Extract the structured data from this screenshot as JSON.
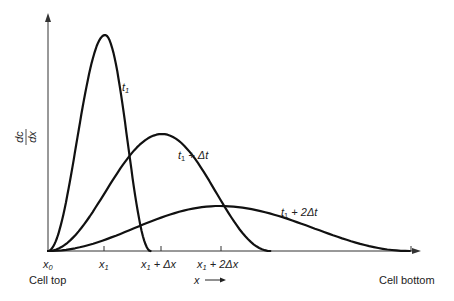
{
  "chart_data": {
    "type": "line",
    "title": "",
    "xlabel": "x",
    "ylabel": "dc/dx",
    "ylabel_numerator": "dc",
    "ylabel_denominator": "dx",
    "x_end_labels": {
      "left": "Cell top",
      "right": "Cell bottom"
    },
    "x_ticks": [
      {
        "value": 0,
        "label_main": "x",
        "label_sub": "0",
        "label_rest": ""
      },
      {
        "value": 1,
        "label_main": "x",
        "label_sub": "1",
        "label_rest": ""
      },
      {
        "value": 2,
        "label_main": "x",
        "label_sub": "1",
        "label_rest": " + Δx"
      },
      {
        "value": 3,
        "label_main": "x",
        "label_sub": "1",
        "label_rest": " + 2Δx"
      }
    ],
    "x_range": [
      0,
      6.6
    ],
    "y_range": [
      0,
      1.0
    ],
    "series": [
      {
        "name": "t1",
        "label_main": "t",
        "label_sub": "1",
        "label_rest": "",
        "peak_x": 1.0,
        "peak_y": 0.96,
        "end_x": 1.8
      },
      {
        "name": "t1 + Δt",
        "label_main": "t",
        "label_sub": "1",
        "label_rest": " + Δt",
        "peak_x": 2.0,
        "peak_y": 0.52,
        "end_x": 3.9
      },
      {
        "name": "t1 + 2Δt",
        "label_main": "t",
        "label_sub": "1",
        "label_rest": " + 2Δt",
        "peak_x": 3.0,
        "peak_y": 0.2,
        "end_x": 6.35
      }
    ],
    "axis_arrow_label": "x →",
    "grid": false,
    "legend": "inline"
  }
}
